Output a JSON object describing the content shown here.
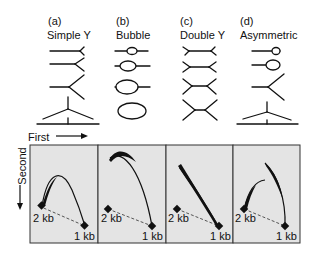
{
  "columns": [
    {
      "letter": "(a)",
      "name": "Simple Y"
    },
    {
      "letter": "(b)",
      "name": "Bubble"
    },
    {
      "letter": "(c)",
      "name": "Double Y"
    },
    {
      "letter": "(d)",
      "name": "Asymmetric"
    }
  ],
  "axes": {
    "first": "First",
    "second": "Second"
  },
  "panels": [
    {
      "marker_2kb": "2 kb",
      "marker_1kb": "1 kb"
    },
    {
      "marker_2kb": "2 kb",
      "marker_1kb": "1 kb"
    },
    {
      "marker_2kb": "2 kb",
      "marker_1kb": "1 kb"
    },
    {
      "marker_2kb": "2 kb",
      "marker_1kb": "1 kb"
    }
  ],
  "colors": {
    "panel_fill": "#e4e4e4",
    "ink": "#111111"
  }
}
